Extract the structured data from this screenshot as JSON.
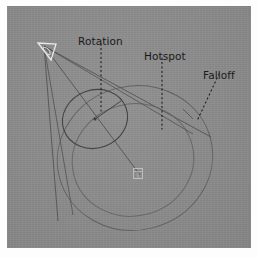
{
  "viewport": {
    "name": "3ds-max-spotlight-viewport",
    "background_color": "#8c8c8c",
    "page_background_color": "#fdfdfd",
    "wire_color": "#4a4a4a",
    "wire_color_light": "#6f6f6f",
    "highlight_color": "#e8e8e8",
    "text_color": "#19191a"
  },
  "labels": {
    "rotation": "Rotation",
    "hotspot": "Hotspot",
    "falloff": "Falloff"
  },
  "gizmo": {
    "light_source_name": "spot-light-source",
    "target_name": "light-target",
    "rotation_ring_name": "rotation-ring",
    "hotspot_cone_name": "hotspot-cone",
    "falloff_cone_name": "falloff-cone"
  }
}
